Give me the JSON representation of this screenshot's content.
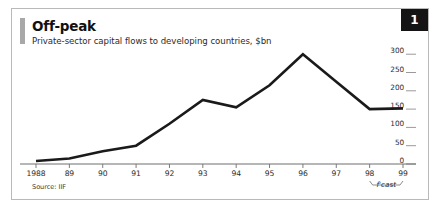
{
  "figure": {
    "badge_number": "1",
    "title": "Off-peak",
    "subtitle": "Private-sector capital flows to developing countries, $bn",
    "source": "Source: IIF",
    "forecast_label": "f'cast"
  },
  "colors": {
    "line": "#1a1a1a",
    "axis": "#6e6e6e",
    "border": "#b9b9b9",
    "accent_bar": "#a8a8a8",
    "badge_bg": "#141414",
    "badge_text": "#ffffff",
    "text": "#2b2b2b"
  },
  "chart_data": {
    "type": "line",
    "title": "Off-peak",
    "subtitle": "Private-sector capital flows to developing countries, $bn",
    "xlabel": "",
    "ylabel": "$bn",
    "categories": [
      "1988",
      "89",
      "90",
      "91",
      "92",
      "93",
      "94",
      "95",
      "96",
      "97",
      "98",
      "99"
    ],
    "x_tick_labels": [
      "1988",
      "89",
      "90",
      "91",
      "92",
      "93",
      "94",
      "95",
      "96",
      "97",
      "98",
      "99"
    ],
    "y_tick_labels": [
      "300",
      "250",
      "200",
      "150",
      "100",
      "50",
      "0"
    ],
    "y_ticks": [
      300,
      250,
      200,
      150,
      100,
      50,
      0
    ],
    "ylim": [
      0,
      320
    ],
    "values": [
      8,
      15,
      35,
      50,
      110,
      175,
      155,
      215,
      300,
      225,
      150,
      152
    ],
    "series": [
      {
        "name": "Private-sector capital flows to developing countries",
        "values": [
          8,
          15,
          35,
          50,
          110,
          175,
          155,
          215,
          300,
          225,
          150,
          152
        ]
      }
    ],
    "annotations": [
      {
        "text": "f'cast",
        "type": "bracket",
        "from_category": "98",
        "to_category": "99",
        "note": "forecast period bracket below x-axis"
      }
    ],
    "grid": false,
    "legend": false,
    "y_axis_position": "right",
    "source": "Source: IIF"
  }
}
